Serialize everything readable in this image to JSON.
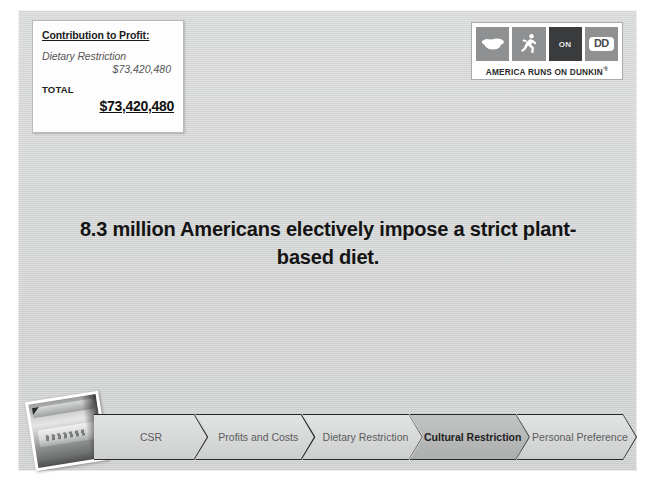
{
  "slide": {
    "background_color": "#d4d5d5"
  },
  "contribution_box": {
    "title": "Contribution to Profit:",
    "item_label": "Dietary Restriction",
    "item_value": "$73,420,480",
    "total_label": "TOTAL",
    "total_value": "$73,420,480"
  },
  "logo": {
    "tiles": [
      {
        "name": "usa-map-icon",
        "text": ""
      },
      {
        "name": "runner-icon",
        "text": ""
      },
      {
        "name": "on-tile",
        "text": "ON"
      },
      {
        "name": "dd-tile",
        "text": "DD"
      }
    ],
    "tagline": "AMERICA RUNS ON DUNKIN",
    "trademark": "'®"
  },
  "headline": {
    "text": "8.3 million Americans electively impose a strict plant-based diet."
  },
  "process": {
    "steps": [
      {
        "label": "CSR",
        "active": false
      },
      {
        "label": "Profits and Costs",
        "active": false
      },
      {
        "label": "Dietary Restriction",
        "active": false
      },
      {
        "label": "Cultural Restriction",
        "active": true
      },
      {
        "label": "Personal Preference",
        "active": false
      }
    ],
    "active_index": 3,
    "active_fill": "#b5b6b6",
    "inactive_fill": "#d8d9d9",
    "border_color": "#27282a"
  },
  "photo": {
    "name": "dunkin-coffee-cup-photo"
  }
}
